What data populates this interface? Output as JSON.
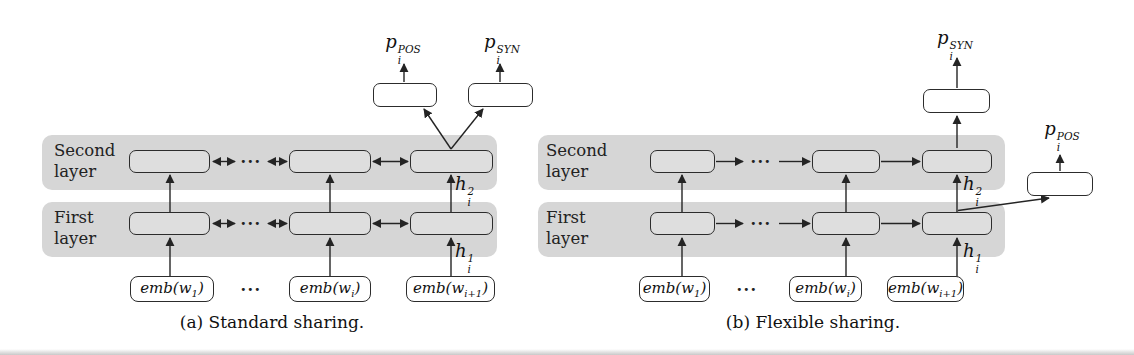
{
  "figure": {
    "band_color": "#d6d6d6",
    "node_fill": "#dedede",
    "line_color": "#242424",
    "output_box_fill": "#ffffff"
  },
  "panel_a": {
    "caption": "(a) Standard sharing.",
    "second_layer_label": {
      "line1": "Second",
      "line2": "layer"
    },
    "first_layer_label": {
      "line1": "First",
      "line2": "layer"
    },
    "output_pos": {
      "base": "p",
      "sub": "i",
      "sup": "POS"
    },
    "output_syn": {
      "base": "p",
      "sub": "i",
      "sup": "SYN"
    },
    "hidden2": {
      "base": "h",
      "sub": "i",
      "sup": "2"
    },
    "hidden1": {
      "base": "h",
      "sub": "i",
      "sup": "1"
    },
    "dots": "···",
    "emb_1": {
      "pre": "emb(w",
      "sub": "1",
      "post": ")"
    },
    "emb_i": {
      "pre": "emb(w",
      "sub": "i",
      "post": ")"
    },
    "emb_i1": {
      "pre": "emb(w",
      "sub": "i+1",
      "post": ")"
    }
  },
  "panel_b": {
    "caption": "(b) Flexible sharing.",
    "second_layer_label": {
      "line1": "Second",
      "line2": "layer"
    },
    "first_layer_label": {
      "line1": "First",
      "line2": "layer"
    },
    "output_pos": {
      "base": "p",
      "sub": "i",
      "sup": "POS"
    },
    "output_syn": {
      "base": "p",
      "sub": "i",
      "sup": "SYN"
    },
    "hidden2": {
      "base": "h",
      "sub": "i",
      "sup": "2"
    },
    "hidden1": {
      "base": "h",
      "sub": "i",
      "sup": "1"
    },
    "dots": "···",
    "emb_1": {
      "pre": "emb(w",
      "sub": "1",
      "post": ")"
    },
    "emb_i": {
      "pre": "emb(w",
      "sub": "i",
      "post": ")"
    },
    "emb_i1": {
      "pre": "emb(w",
      "sub": "i+1",
      "post": ")"
    }
  }
}
